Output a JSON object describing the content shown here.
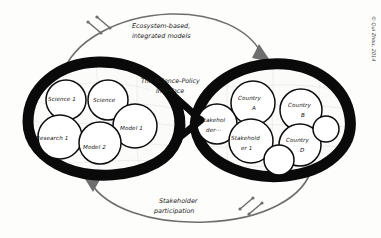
{
  "diagram": {
    "title": "The Science-Policy Interface",
    "center_label_line1": "The Science-Policy",
    "center_label_line2": "Interface",
    "credit": "© Qui Zhou, 2014",
    "background_color": "#fdfdfc",
    "ink_color": "#0a0a0a",
    "arrow_color": "#6e6e6e"
  },
  "annotations": [
    {
      "id": "top-flow",
      "line1": "Ecosystem-based,",
      "line2": "integrated models",
      "direction": "left-to-right"
    },
    {
      "id": "bottom-flow",
      "line1": "Stakeholder",
      "line2": "participation",
      "direction": "right-to-left"
    }
  ],
  "left_lobe": {
    "name": "science-lobe",
    "nodes": [
      {
        "id": "science-1",
        "label": "Science 1"
      },
      {
        "id": "science",
        "label": "Science"
      },
      {
        "id": "model-1",
        "label": "Model 1"
      },
      {
        "id": "research-1",
        "label": "Research 1"
      },
      {
        "id": "model-2",
        "label": "Model 2"
      }
    ]
  },
  "right_lobe": {
    "name": "policy-lobe",
    "nodes": [
      {
        "id": "country-a",
        "label_line1": "Country",
        "label_line2": "A"
      },
      {
        "id": "country-b",
        "label_line1": "Country",
        "label_line2": "B"
      },
      {
        "id": "stakeholder-dots",
        "label_line1": "Stakehol",
        "label_line2": "der···"
      },
      {
        "id": "stakeholder-1",
        "label_line1": "Stakehold",
        "label_line2": "er 1"
      },
      {
        "id": "country-d",
        "label_line1": "Country",
        "label_line2": "D"
      }
    ]
  }
}
